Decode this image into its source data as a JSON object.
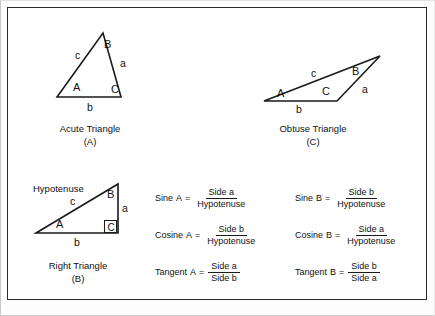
{
  "figure": {
    "background_color": "#ffffff",
    "line_color": "#1a1a1a",
    "frame_color": "#2b2b2b"
  },
  "acute_triangle": {
    "caption_name": "Acute Triangle",
    "caption_key": "(A)",
    "vertices": {
      "A": "A",
      "B": "B",
      "C": "C"
    },
    "sides": {
      "a": "a",
      "b": "b",
      "c": "c"
    }
  },
  "obtuse_triangle": {
    "caption_name": "Obtuse Triangle",
    "caption_key": "(C)",
    "vertices": {
      "A": "A",
      "B": "B",
      "C": "C"
    },
    "sides": {
      "a": "a",
      "b": "b",
      "c": "c"
    }
  },
  "right_triangle": {
    "caption_name": "Right Triangle",
    "caption_key": "(B)",
    "hypotenuse_label": "Hypotenuse",
    "vertices": {
      "A": "A",
      "B": "B",
      "C": "C"
    },
    "sides": {
      "a": "a",
      "b": "b",
      "c": "c"
    }
  },
  "formulas": {
    "column_a": [
      {
        "name": "Sine",
        "angle": "A",
        "equals": "=",
        "numerator": "Side  a",
        "denominator": "Hypotenuse"
      },
      {
        "name": "Cosine",
        "angle": "A",
        "equals": "=",
        "numerator": "Side  b",
        "denominator": "Hypotenuse"
      },
      {
        "name": "Tangent",
        "angle": "A",
        "equals": "=",
        "numerator": "Side  a",
        "denominator": "Side  b"
      }
    ],
    "column_b": [
      {
        "name": "Sine",
        "angle": "B",
        "equals": "=",
        "numerator": "Side  b",
        "denominator": "Hypotenuse"
      },
      {
        "name": "Cosine",
        "angle": "B",
        "equals": "=",
        "numerator": "Side  a",
        "denominator": "Hypotenuse"
      },
      {
        "name": "Tangent",
        "angle": "B",
        "equals": "=",
        "numerator": "Side  b",
        "denominator": "Side  a"
      }
    ]
  }
}
